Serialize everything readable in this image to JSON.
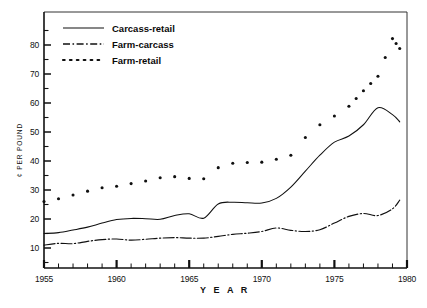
{
  "chart_data": {
    "type": "line",
    "title": "",
    "xlabel": "Y E A R",
    "ylabel": "¢ PER POUND",
    "xlim": [
      1955,
      1980
    ],
    "ylim": [
      0,
      85
    ],
    "y_axis_ticks": [
      10,
      20,
      30,
      40,
      50,
      60,
      70,
      80
    ],
    "y_minor_tick_step": 5,
    "x_axis_ticks": [
      1955,
      1960,
      1965,
      1970,
      1975,
      1980
    ],
    "x_minor_tick_step": 1,
    "grid": false,
    "legend_position": "top-left",
    "x": [
      1955,
      1956,
      1957,
      1958,
      1959,
      1960,
      1961,
      1962,
      1963,
      1964,
      1965,
      1966,
      1967,
      1968,
      1969,
      1970,
      1971,
      1972,
      1973,
      1974,
      1975,
      1976,
      1977,
      1978
    ],
    "series": [
      {
        "name": "Carcass-retail",
        "style": "solid",
        "color": "#101010",
        "values": [
          15.0,
          15.3,
          16.2,
          17.2,
          18.6,
          19.8,
          20.2,
          20.1,
          19.9,
          21.2,
          21.8,
          20.3,
          25.2,
          25.8,
          25.6,
          25.5,
          27.1,
          31.0,
          36.5,
          42.0,
          46.5,
          48.6,
          52.5,
          58.4
        ]
      },
      {
        "name": "Farm-carcass",
        "style": "dash-dot",
        "color": "#101010",
        "values": [
          11.0,
          11.6,
          11.5,
          12.3,
          12.9,
          13.1,
          12.7,
          13.0,
          13.4,
          13.6,
          13.4,
          13.4,
          14.0,
          14.7,
          15.1,
          15.7,
          16.9,
          16.1,
          15.7,
          16.3,
          18.6,
          20.9,
          21.9,
          21.2
        ]
      },
      {
        "name": "Farm-retail",
        "style": "dotted",
        "color": "#101010",
        "values": [
          26.0,
          27.0,
          28.3,
          29.6,
          30.8,
          31.3,
          32.2,
          33.1,
          34.2,
          34.6,
          34.0,
          33.9,
          37.7,
          39.2,
          39.5,
          39.6,
          40.6,
          42.0,
          48.1,
          52.5,
          55.5,
          58.9,
          64.2,
          69.2
        ]
      }
    ],
    "series_tail": {
      "note_x": [
        1979,
        1979.5
      ],
      "Carcass-retail_extra": [
        56.0,
        53.5
      ],
      "Farm-carcass_extra": [
        23.5,
        26.5
      ],
      "Farm-retail_extra": [
        82.2,
        78.8
      ]
    }
  },
  "legend": {
    "items": [
      {
        "label": "Carcass-retail",
        "style": "solid"
      },
      {
        "label": "Farm-carcass",
        "style": "dash-dot"
      },
      {
        "label": "Farm-retail",
        "style": "dotted"
      }
    ]
  },
  "axes": {
    "y_title": "¢ PER POUND",
    "x_title": "Y E A R",
    "y_tick_labels": [
      "80",
      "70",
      "60",
      "50",
      "40",
      "30",
      "20",
      "10"
    ],
    "x_tick_labels": [
      "1955",
      "1960",
      "1965",
      "1970",
      "1975",
      "1980"
    ]
  }
}
